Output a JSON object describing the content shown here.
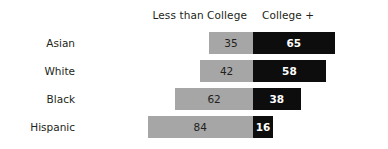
{
  "chart_data": {
    "type": "bar",
    "subtype": "diverging-stacked-bar-100",
    "title": "",
    "subtitle": "",
    "xlabel": "",
    "ylabel": "",
    "orientation": "horizontal",
    "stacked": true,
    "grid": false,
    "legend_position": "top",
    "axis_center_value": 0,
    "value_unit": "percent",
    "xlim": [
      0,
      100
    ],
    "categories": [
      "Asian",
      "White",
      "Black",
      "Hispanic"
    ],
    "series": [
      {
        "name": "Less than College",
        "color": "#a6a6a6",
        "direction": "left",
        "values": [
          35,
          42,
          62,
          84
        ]
      },
      {
        "name": "College +",
        "color": "#0d0d0d",
        "direction": "right",
        "values": [
          65,
          58,
          38,
          16
        ]
      }
    ],
    "rows": [
      {
        "label": "Asian",
        "less_than_college": 35,
        "college_plus": 65,
        "less_than_college_text": "35",
        "college_plus_text": "65"
      },
      {
        "label": "White",
        "less_than_college": 42,
        "college_plus": 58,
        "less_than_college_text": "42",
        "college_plus_text": "58"
      },
      {
        "label": "Black",
        "less_than_college": 62,
        "college_plus": 38,
        "less_than_college_text": "62",
        "college_plus_text": "38"
      },
      {
        "label": "Hispanic",
        "less_than_college": 84,
        "college_plus": 16,
        "less_than_college_text": "84",
        "college_plus_text": "16"
      }
    ]
  },
  "header": {
    "less_than_college": "Less than College",
    "college_plus": "College +"
  },
  "colors": {
    "less_than_college": "#a6a6a6",
    "college_plus": "#0d0d0d",
    "background": "#ffffff",
    "text": "#231f20",
    "inverse_text": "#ffffff"
  }
}
